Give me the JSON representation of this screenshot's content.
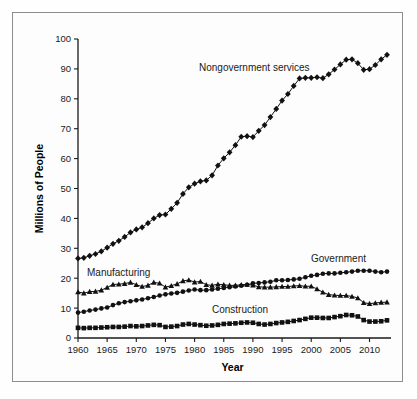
{
  "figure": {
    "border_color": "#8d8d8d",
    "background": "#fdfdfd"
  },
  "axes": {
    "y_title": "Millions of People",
    "x_title": "Year",
    "y_ticks": [
      "0",
      "10",
      "20",
      "30",
      "40",
      "50",
      "60",
      "70",
      "80",
      "90",
      "100"
    ],
    "x_ticks": [
      "1960",
      "1965",
      "1970",
      "1975",
      "1980",
      "1985",
      "1990",
      "1995",
      "2000",
      "2005",
      "2010"
    ]
  },
  "labels": {
    "nongovernment": "Nongovernment services",
    "manufacturing": "Manufacturing",
    "government": "Government",
    "construction": "Construction"
  },
  "chart_data": {
    "type": "line",
    "title": "",
    "xlabel": "Year",
    "ylabel": "Millions of People",
    "xlim": [
      1960,
      2013
    ],
    "ylim": [
      0,
      100
    ],
    "grid": false,
    "legend": "inline-annotations",
    "x": [
      1960,
      1961,
      1962,
      1963,
      1964,
      1965,
      1966,
      1967,
      1968,
      1969,
      1970,
      1971,
      1972,
      1973,
      1974,
      1975,
      1976,
      1977,
      1978,
      1979,
      1980,
      1981,
      1982,
      1983,
      1984,
      1985,
      1986,
      1987,
      1988,
      1989,
      1990,
      1991,
      1992,
      1993,
      1994,
      1995,
      1996,
      1997,
      1998,
      1999,
      2000,
      2001,
      2002,
      2003,
      2004,
      2005,
      2006,
      2007,
      2008,
      2009,
      2010,
      2011,
      2012,
      2013
    ],
    "series": [
      {
        "name": "Nongovernment services",
        "marker": "diamond",
        "color": "#111111",
        "values": [
          26.6,
          26.8,
          27.5,
          28.1,
          29.0,
          30.2,
          31.5,
          32.5,
          33.8,
          35.3,
          36.3,
          37.0,
          38.4,
          40.0,
          41.1,
          41.3,
          43.2,
          45.2,
          48.2,
          50.4,
          51.6,
          52.4,
          52.7,
          54.4,
          57.7,
          60.1,
          62.1,
          64.5,
          67.3,
          67.5,
          67.2,
          69.3,
          71.2,
          73.9,
          76.6,
          79.4,
          81.6,
          84.3,
          86.8,
          87.0,
          87.0,
          87.2,
          86.9,
          88.2,
          89.8,
          91.5,
          93.1,
          93.2,
          91.9,
          89.7,
          89.9,
          91.3,
          93.2,
          94.7
        ]
      },
      {
        "name": "Government",
        "marker": "circle",
        "color": "#111111",
        "values": [
          8.5,
          8.8,
          9.2,
          9.5,
          9.9,
          10.2,
          11.0,
          11.6,
          12.0,
          12.3,
          12.6,
          12.9,
          13.3,
          13.7,
          14.2,
          14.6,
          14.9,
          15.1,
          15.5,
          15.9,
          16.2,
          16.0,
          16.0,
          16.2,
          16.5,
          16.7,
          17.0,
          17.2,
          17.5,
          17.8,
          18.3,
          18.4,
          18.6,
          18.8,
          19.3,
          19.3,
          19.4,
          19.6,
          19.8,
          20.3,
          20.8,
          21.1,
          21.5,
          21.6,
          21.6,
          21.8,
          22.0,
          22.2,
          22.5,
          22.5,
          22.5,
          22.2,
          22.0,
          22.2
        ]
      },
      {
        "name": "Manufacturing",
        "marker": "triangle",
        "color": "#111111",
        "values": [
          15.4,
          15.0,
          15.5,
          15.6,
          16.0,
          16.9,
          17.9,
          18.0,
          18.2,
          18.6,
          17.8,
          17.2,
          17.6,
          18.6,
          18.3,
          17.0,
          17.5,
          18.1,
          19.1,
          19.4,
          18.7,
          18.9,
          17.8,
          17.6,
          18.0,
          17.8,
          17.6,
          17.6,
          17.8,
          17.9,
          17.7,
          17.1,
          17.0,
          17.0,
          17.1,
          17.2,
          17.2,
          17.4,
          17.5,
          17.3,
          17.3,
          16.4,
          15.3,
          14.5,
          14.3,
          14.2,
          14.2,
          13.9,
          13.4,
          11.8,
          11.5,
          11.7,
          11.9,
          12.0
        ]
      },
      {
        "name": "Construction",
        "marker": "square",
        "color": "#111111",
        "values": [
          3.4,
          3.3,
          3.4,
          3.4,
          3.5,
          3.6,
          3.7,
          3.7,
          3.8,
          4.0,
          3.9,
          4.0,
          4.2,
          4.4,
          4.3,
          3.7,
          3.8,
          4.0,
          4.5,
          4.7,
          4.5,
          4.3,
          4.1,
          4.2,
          4.4,
          4.7,
          4.8,
          4.9,
          5.1,
          5.2,
          5.1,
          4.7,
          4.5,
          4.7,
          5.0,
          5.2,
          5.4,
          5.7,
          6.0,
          6.4,
          6.8,
          6.8,
          6.7,
          6.7,
          7.0,
          7.3,
          7.7,
          7.6,
          7.2,
          6.0,
          5.5,
          5.5,
          5.6,
          5.9
        ]
      }
    ]
  },
  "annotation_positions": {
    "nongovernment": {
      "x": 199,
      "y": 71
    },
    "manufacturing": {
      "x": 87,
      "y": 276
    },
    "government": {
      "x": 311,
      "y": 262
    },
    "construction": {
      "x": 212,
      "y": 313
    }
  }
}
